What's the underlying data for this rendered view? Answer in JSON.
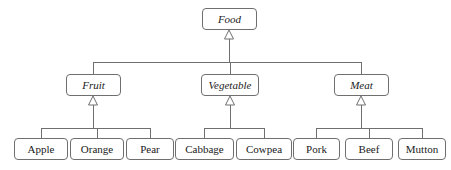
{
  "diagram": {
    "kind": "uml-generalization-hierarchy",
    "stroke_color": "#6f6f6f",
    "text_color": "#1a1a1a",
    "background_color": "#ffffff",
    "arrowhead": "hollow-triangle",
    "nodes": {
      "food": {
        "label": "Food",
        "style": "abstract",
        "x": 202,
        "y": 8,
        "w": 55,
        "h": 22
      },
      "fruit": {
        "label": "Fruit",
        "style": "abstract",
        "x": 66,
        "y": 74,
        "w": 55,
        "h": 22
      },
      "vegetable": {
        "label": "Vegetable",
        "style": "abstract",
        "x": 201,
        "y": 74,
        "w": 58,
        "h": 22
      },
      "meat": {
        "label": "Meat",
        "style": "abstract",
        "x": 334,
        "y": 74,
        "w": 55,
        "h": 22
      },
      "apple": {
        "label": "Apple",
        "style": "concrete",
        "x": 14,
        "y": 138,
        "w": 54,
        "h": 22
      },
      "orange": {
        "label": "Orange",
        "style": "concrete",
        "x": 70,
        "y": 138,
        "w": 54,
        "h": 22
      },
      "pear": {
        "label": "Pear",
        "style": "concrete",
        "x": 126,
        "y": 138,
        "w": 48,
        "h": 22
      },
      "cabbage": {
        "label": "Cabbage",
        "style": "concrete",
        "x": 175,
        "y": 138,
        "w": 59,
        "h": 22
      },
      "cowpea": {
        "label": "Cowpea",
        "style": "concrete",
        "x": 236,
        "y": 138,
        "w": 56,
        "h": 22
      },
      "pork": {
        "label": "Pork",
        "style": "concrete",
        "x": 293,
        "y": 138,
        "w": 47,
        "h": 22
      },
      "beef": {
        "label": "Beef",
        "style": "concrete",
        "x": 345,
        "y": 138,
        "w": 48,
        "h": 22
      },
      "mutton": {
        "label": "Mutton",
        "style": "concrete",
        "x": 398,
        "y": 138,
        "w": 48,
        "h": 22
      }
    },
    "edges": [
      {
        "from": "fruit",
        "to": "food"
      },
      {
        "from": "vegetable",
        "to": "food"
      },
      {
        "from": "meat",
        "to": "food"
      },
      {
        "from": "apple",
        "to": "fruit"
      },
      {
        "from": "orange",
        "to": "fruit"
      },
      {
        "from": "pear",
        "to": "fruit"
      },
      {
        "from": "cabbage",
        "to": "vegetable"
      },
      {
        "from": "cowpea",
        "to": "vegetable"
      },
      {
        "from": "pork",
        "to": "meat"
      },
      {
        "from": "beef",
        "to": "meat"
      },
      {
        "from": "mutton",
        "to": "meat"
      }
    ],
    "groups": [
      {
        "parent": "food",
        "bus_y": 62,
        "bus_x1": 93,
        "bus_x2": 361,
        "trunk_from_y": 39,
        "arrow_tip_y": 30,
        "arrow_parent_x": 229
      },
      {
        "parent": "fruit",
        "bus_y": 128,
        "bus_x1": 41,
        "bus_x2": 150,
        "trunk_from_y": 105,
        "arrow_tip_y": 96,
        "arrow_parent_x": 93
      },
      {
        "parent": "vegetable",
        "bus_y": 128,
        "bus_x1": 204,
        "bus_x2": 264,
        "trunk_from_y": 105,
        "arrow_tip_y": 96,
        "arrow_parent_x": 230
      },
      {
        "parent": "meat",
        "bus_y": 128,
        "bus_x1": 316,
        "bus_x2": 422,
        "trunk_from_y": 105,
        "arrow_tip_y": 96,
        "arrow_parent_x": 361
      }
    ]
  }
}
